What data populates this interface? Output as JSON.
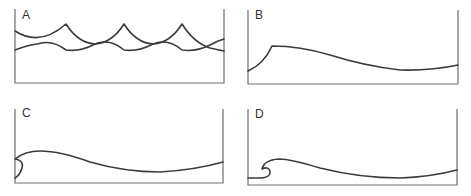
{
  "figure": {
    "panels": [
      {
        "label": "A",
        "description": "Overlapping symmetric cusped waves (two phase-shifted trains)"
      },
      {
        "label": "B",
        "description": "Wave with steep concave front face at left"
      },
      {
        "label": "C",
        "description": "Wave crest with plunging lip curling at left wall"
      },
      {
        "label": "D",
        "description": "Wave with fully curled breaking lip at left"
      }
    ]
  },
  "colors": {
    "line": "#3a3a3a",
    "frame": "#6e6e6e",
    "background": "#ffffff"
  }
}
